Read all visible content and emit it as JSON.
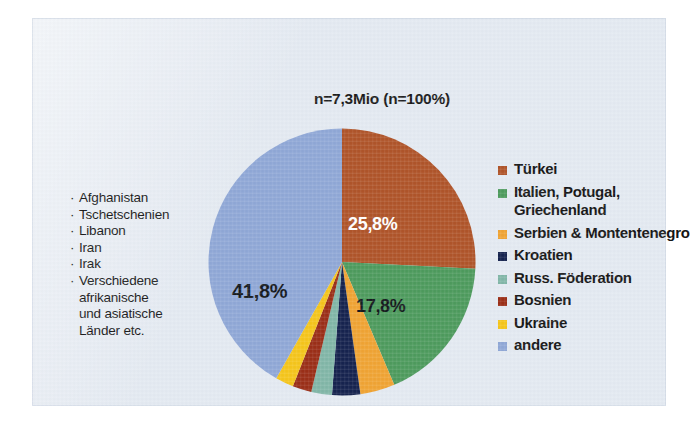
{
  "panel": {
    "background_color": "#e4eaf2"
  },
  "chart_data": {
    "type": "pie",
    "title": "n=7,3Mio (n=100%)",
    "xlabel": "",
    "ylabel": "",
    "legend_position": "right",
    "grid": false,
    "total_label": "n=7,3Mio (n=100%)",
    "categories": [
      "Türkei",
      "Italien, Potugal, Griechenland",
      "Serbien & Montentenegro",
      "Kroatien",
      "Russ. Föderation",
      "Bosnien",
      "Ukraine",
      "andere"
    ],
    "values": [
      25.8,
      17.8,
      4.2,
      3.4,
      2.5,
      2.3,
      2.2,
      41.8
    ],
    "value_labels": [
      "25,8%",
      "17,8%",
      "",
      "",
      "",
      "",
      "",
      "41,8%"
    ],
    "colors": [
      "#b0552a",
      "#4e9b5e",
      "#f0a434",
      "#16234f",
      "#82b7a8",
      "#9b2f18",
      "#f5c61c",
      "#90a8d7"
    ],
    "visible_labels": [
      {
        "slice": "Türkei",
        "text": "25,8%"
      },
      {
        "slice": "Italien, Potugal, Griechenland",
        "text": "17,8%"
      },
      {
        "slice": "andere",
        "text": "41,8%"
      }
    ]
  },
  "legend": {
    "items": [
      {
        "label": "Türkei",
        "color": "#b0552a"
      },
      {
        "label": "Italien, Potugal, Griechenland",
        "color": "#4e9b5e"
      },
      {
        "label": "Serbien & Montentenegro",
        "color": "#f0a434"
      },
      {
        "label": "Kroatien",
        "color": "#16234f"
      },
      {
        "label": "Russ. Föderation",
        "color": "#82b7a8"
      },
      {
        "label": "Bosnien",
        "color": "#9b2f18"
      },
      {
        "label": "Ukraine",
        "color": "#f5c61c"
      },
      {
        "label": "andere",
        "color": "#90a8d7"
      }
    ]
  },
  "annotation": {
    "bullet": "·",
    "items": [
      "Afghanistan",
      "Tschetschenien",
      "Libanon",
      "Iran",
      "Irak",
      "Verschiedene"
    ],
    "continuation": [
      "afrikanische",
      "und asiatische",
      "Länder etc."
    ]
  }
}
